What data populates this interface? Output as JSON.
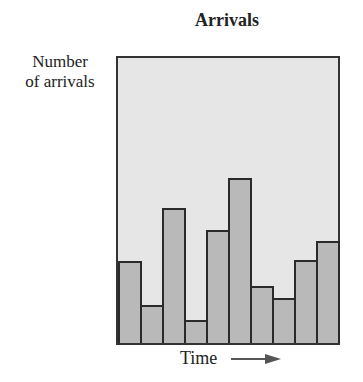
{
  "chart_data": {
    "type": "bar",
    "title": "Arrivals",
    "xlabel": "Time",
    "ylabel": "Number of arrivals",
    "categories": [
      "1",
      "2",
      "3",
      "4",
      "5",
      "6",
      "7",
      "8",
      "9",
      "10"
    ],
    "values": [
      82,
      38,
      135,
      23,
      113,
      165,
      57,
      45,
      83,
      102
    ],
    "units": "relative (no numeric axis shown)",
    "ylim": [
      0,
      285
    ],
    "grid": false,
    "legend": null,
    "colors": {
      "bar_fill": "#b9b9b9",
      "bar_edge": "#2a2a2a",
      "plot_bg": "#e6e6e6"
    }
  },
  "labels": {
    "title": "Arrivals",
    "ylabel_line1": "Number",
    "ylabel_line2": "of arrivals",
    "xlabel": "Time"
  }
}
